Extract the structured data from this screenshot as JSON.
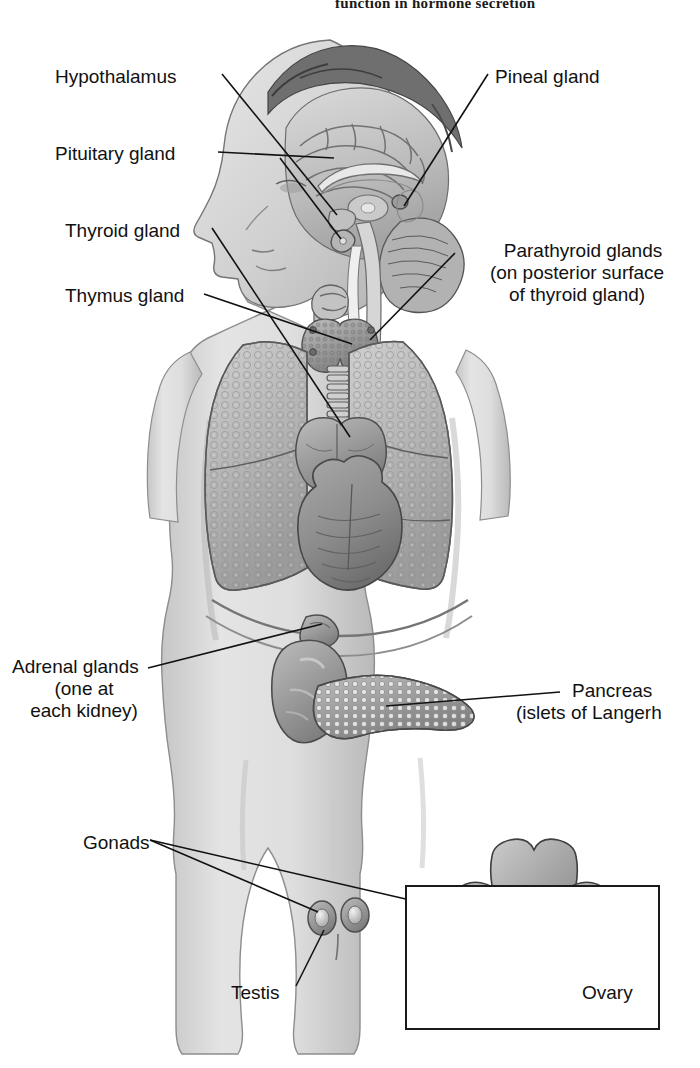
{
  "figure": {
    "running_head": "function in hormone secretion",
    "title_alt": "The endocrine system",
    "type": "anatomical-diagram",
    "view": "anterior torso with mid-sagittal head section",
    "colors": {
      "ink": "#111111",
      "paper": "#ffffff",
      "skin_light": "#d9d9d9",
      "skin_mid": "#bdbdbd",
      "organ_mid": "#a8a8a8",
      "organ_dark": "#7d7d7d",
      "outline": "#4a4a4a"
    }
  },
  "labels": {
    "hypothalamus": "Hypothalamus",
    "pituitary": "Pituitary gland",
    "pineal": "Pineal gland",
    "thyroid": "Thyroid gland",
    "thymus": "Thymus gland",
    "parathyroid_l1": "Parathyroid glands",
    "parathyroid_l2": "(on posterior surface",
    "parathyroid_l3": "of thyroid gland)",
    "adrenal_l1": "Adrenal glands",
    "adrenal_l2": "(one at",
    "adrenal_l3": "each kidney)",
    "pancreas_l1": "Pancreas",
    "pancreas_l2": "(islets of Langerh",
    "gonads": "Gonads",
    "testis": "Testis",
    "ovary": "Ovary"
  },
  "structures": [
    {
      "name": "brain-cerebrum",
      "labeled": false
    },
    {
      "name": "cerebellum",
      "labeled": false
    },
    {
      "name": "brainstem",
      "labeled": false
    },
    {
      "name": "hypothalamus",
      "labeled": true
    },
    {
      "name": "pituitary-gland",
      "labeled": true
    },
    {
      "name": "pineal-gland",
      "labeled": true
    },
    {
      "name": "larynx",
      "labeled": false
    },
    {
      "name": "thyroid-gland",
      "labeled": true
    },
    {
      "name": "parathyroid-glands",
      "labeled": true
    },
    {
      "name": "trachea",
      "labeled": false
    },
    {
      "name": "thymus-gland",
      "labeled": true
    },
    {
      "name": "left-lung",
      "labeled": false
    },
    {
      "name": "right-lung",
      "labeled": false
    },
    {
      "name": "heart",
      "labeled": false
    },
    {
      "name": "diaphragm",
      "labeled": false
    },
    {
      "name": "kidney",
      "labeled": false
    },
    {
      "name": "adrenal-gland",
      "labeled": true
    },
    {
      "name": "pancreas",
      "labeled": true
    },
    {
      "name": "testis",
      "labeled": true
    },
    {
      "name": "ovary",
      "labeled": true
    },
    {
      "name": "uterus",
      "labeled": false
    },
    {
      "name": "fallopian-tube",
      "labeled": false
    }
  ],
  "inset": {
    "name": "female-reproductive-inset",
    "contents": "uterus, fallopian tubes and ovaries"
  }
}
